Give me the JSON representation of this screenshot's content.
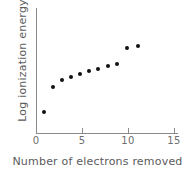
{
  "chart_data": {
    "type": "scatter",
    "title": "",
    "xlabel": "Number of electrons removed",
    "ylabel": "Log ionization energy",
    "xlim": [
      0,
      15
    ],
    "ylim": [
      0,
      1
    ],
    "grid": false,
    "legend": null,
    "x_ticks": [
      0,
      5,
      10,
      15
    ],
    "x_tick_labels": [
      "0",
      "5",
      "10",
      "15"
    ],
    "y_ticks": [],
    "y_tick_labels": [],
    "marker": "filled-circle",
    "marker_color": "#111111",
    "axis_color": "#8a8a8a",
    "x": [
      1,
      2,
      3,
      4,
      5,
      6,
      7,
      8,
      9,
      10,
      11
    ],
    "y": [
      0.17,
      0.37,
      0.42,
      0.46,
      0.49,
      0.52,
      0.55,
      0.58,
      0.6,
      0.75,
      0.77
    ],
    "points": [
      {
        "x": 1,
        "y": 0.17,
        "px": 44,
        "py": 112
      },
      {
        "x": 2,
        "y": 0.37,
        "px": 53,
        "py": 87
      },
      {
        "x": 3,
        "y": 0.42,
        "px": 62,
        "py": 80
      },
      {
        "x": 4,
        "y": 0.46,
        "px": 71,
        "py": 77
      },
      {
        "x": 5,
        "y": 0.49,
        "px": 80,
        "py": 74
      },
      {
        "x": 6,
        "y": 0.52,
        "px": 89,
        "py": 71
      },
      {
        "x": 7,
        "y": 0.55,
        "px": 98,
        "py": 69
      },
      {
        "x": 8,
        "y": 0.58,
        "px": 108,
        "py": 66
      },
      {
        "x": 9,
        "y": 0.6,
        "px": 117,
        "py": 64
      },
      {
        "x": 10,
        "y": 0.75,
        "px": 127,
        "py": 48
      },
      {
        "x": 11,
        "y": 0.77,
        "px": 138,
        "py": 46
      }
    ]
  },
  "axis": {
    "x_tick_pixels": [
      36,
      82,
      128,
      174
    ]
  }
}
